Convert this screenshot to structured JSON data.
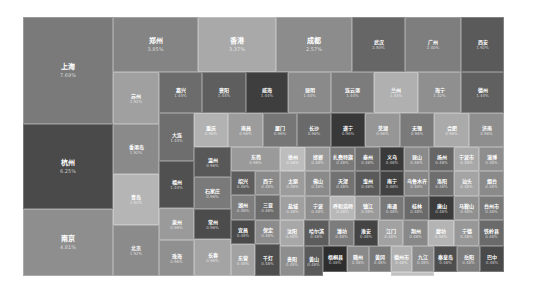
{
  "chart_data": {
    "type": "treemap",
    "title": "",
    "unit": "%",
    "items": [
      {
        "name": "上海",
        "value": 7.69,
        "label": "7.69%",
        "x": 0,
        "y": 0,
        "w": 90,
        "h": 107,
        "color": "#7a7a7a"
      },
      {
        "name": "杭州",
        "value": 6.25,
        "label": "6.25%",
        "x": 0,
        "y": 107,
        "w": 90,
        "h": 85,
        "color": "#4a4a4a"
      },
      {
        "name": "南京",
        "value": 4.81,
        "label": "4.81%",
        "x": 0,
        "y": 192,
        "w": 90,
        "h": 67,
        "color": "#8e8e8e"
      },
      {
        "name": "郑州",
        "value": 3.85,
        "label": "3.85%",
        "x": 90,
        "y": 0,
        "w": 85,
        "h": 55,
        "color": "#848484"
      },
      {
        "name": "香港",
        "value": 3.37,
        "label": "3.37%",
        "x": 175,
        "y": 0,
        "w": 78,
        "h": 55,
        "color": "#a9a9a9"
      },
      {
        "name": "成都",
        "value": 2.57,
        "label": "2.57%",
        "x": 253,
        "y": 0,
        "w": 76,
        "h": 55,
        "color": "#8c8c8c"
      },
      {
        "name": "武汉",
        "value": 2.5,
        "label": "2.50%",
        "x": 329,
        "y": 0,
        "w": 53,
        "h": 55,
        "color": "#666666"
      },
      {
        "name": "广州",
        "value": 2.4,
        "label": "2.40%",
        "x": 382,
        "y": 0,
        "w": 56,
        "h": 55,
        "color": "#7e7e7e"
      },
      {
        "name": "西安",
        "value": 1.92,
        "label": "1.92%",
        "x": 438,
        "y": 0,
        "w": 43,
        "h": 55,
        "color": "#5a5a5a"
      },
      {
        "name": "苏州",
        "value": 1.92,
        "label": "1.92%",
        "x": 90,
        "y": 55,
        "w": 46,
        "h": 52,
        "color": "#a0a0a0"
      },
      {
        "name": "嘉兴",
        "value": 1.44,
        "label": "1.44%",
        "x": 136,
        "y": 55,
        "w": 43,
        "h": 41,
        "color": "#6c6c6c"
      },
      {
        "name": "襄阳",
        "value": 1.44,
        "label": "1.44%",
        "x": 179,
        "y": 55,
        "w": 44,
        "h": 41,
        "color": "#5e5e5e"
      },
      {
        "name": "威海",
        "value": 1.44,
        "label": "1.44%",
        "x": 223,
        "y": 55,
        "w": 42,
        "h": 41,
        "color": "#3e3e3e"
      },
      {
        "name": "昆明",
        "value": 1.44,
        "label": "1.44%",
        "x": 265,
        "y": 55,
        "w": 43,
        "h": 41,
        "color": "#8a8a8a"
      },
      {
        "name": "连云港",
        "value": 1.44,
        "label": "1.44%",
        "x": 308,
        "y": 55,
        "w": 43,
        "h": 41,
        "color": "#7c7c7c"
      },
      {
        "name": "兰州",
        "value": 1.44,
        "label": "1.44%",
        "x": 351,
        "y": 55,
        "w": 44,
        "h": 41,
        "color": "#b0b0b0"
      },
      {
        "name": "海宁",
        "value": 1.32,
        "label": "1.32%",
        "x": 395,
        "y": 55,
        "w": 43,
        "h": 41,
        "color": "#8f8f8f"
      },
      {
        "name": "德州",
        "value": 1.44,
        "label": "1.44%",
        "x": 438,
        "y": 55,
        "w": 43,
        "h": 41,
        "color": "#606060"
      },
      {
        "name": "香港岛",
        "value": 1.92,
        "label": "1.92%",
        "x": 90,
        "y": 107,
        "w": 46,
        "h": 50,
        "color": "#8a8a8a"
      },
      {
        "name": "青岛",
        "value": 1.92,
        "label": "1.92%",
        "x": 90,
        "y": 157,
        "w": 46,
        "h": 51,
        "color": "#b5b5b5"
      },
      {
        "name": "北京",
        "value": 1.92,
        "label": "1.92%",
        "x": 90,
        "y": 208,
        "w": 46,
        "h": 51,
        "color": "#8b8b8b"
      },
      {
        "name": "大连",
        "value": 1.44,
        "label": "1.44%",
        "x": 136,
        "y": 96,
        "w": 35,
        "h": 48,
        "color": "#6e6e6e"
      },
      {
        "name": "福州",
        "value": 1.44,
        "label": "1.44%",
        "x": 136,
        "y": 144,
        "w": 35,
        "h": 47,
        "color": "#505050"
      },
      {
        "name": "泉州",
        "value": 0.96,
        "label": "0.96%",
        "x": 136,
        "y": 191,
        "w": 35,
        "h": 32,
        "color": "#9a9a9a"
      },
      {
        "name": "珠海",
        "value": 0.96,
        "label": "0.96%",
        "x": 136,
        "y": 223,
        "w": 35,
        "h": 36,
        "color": "#909090"
      },
      {
        "name": "重庆",
        "value": 0.96,
        "label": "0.96%",
        "x": 171,
        "y": 96,
        "w": 34,
        "h": 34,
        "color": "#b2b2b2"
      },
      {
        "name": "南昌",
        "value": 0.96,
        "label": "0.96%",
        "x": 205,
        "y": 96,
        "w": 35,
        "h": 34,
        "color": "#9c9c9c"
      },
      {
        "name": "厦门",
        "value": 0.96,
        "label": "0.96%",
        "x": 240,
        "y": 96,
        "w": 34,
        "h": 34,
        "color": "#767676"
      },
      {
        "name": "长沙",
        "value": 0.96,
        "label": "0.96%",
        "x": 274,
        "y": 96,
        "w": 34,
        "h": 34,
        "color": "#6a6a6a"
      },
      {
        "name": "遂宁",
        "value": 0.96,
        "label": "0.96%",
        "x": 308,
        "y": 96,
        "w": 34,
        "h": 34,
        "color": "#383838"
      },
      {
        "name": "芜湖",
        "value": 0.96,
        "label": "0.96%",
        "x": 342,
        "y": 96,
        "w": 35,
        "h": 34,
        "color": "#969696"
      },
      {
        "name": "无锡",
        "value": 0.96,
        "label": "0.96%",
        "x": 377,
        "y": 96,
        "w": 34,
        "h": 34,
        "color": "#7a7a7a"
      },
      {
        "name": "合肥",
        "value": 0.96,
        "label": "0.96%",
        "x": 411,
        "y": 96,
        "w": 35,
        "h": 34,
        "color": "#aaaaaa"
      },
      {
        "name": "济南",
        "value": 0.96,
        "label": "0.96%",
        "x": 446,
        "y": 96,
        "w": 35,
        "h": 34,
        "color": "#8e8e8e"
      },
      {
        "name": "温州",
        "value": 0.96,
        "label": "0.96%",
        "x": 171,
        "y": 130,
        "w": 37,
        "h": 30,
        "color": "#585858"
      },
      {
        "name": "石家庄",
        "value": 0.96,
        "label": "0.96%",
        "x": 171,
        "y": 160,
        "w": 37,
        "h": 32,
        "color": "#7a7a7a"
      },
      {
        "name": "常州",
        "value": 0.96,
        "label": "0.96%",
        "x": 171,
        "y": 192,
        "w": 37,
        "h": 30,
        "color": "#4c4c4c"
      },
      {
        "name": "长春",
        "value": 0.96,
        "label": "0.96%",
        "x": 171,
        "y": 222,
        "w": 37,
        "h": 37,
        "color": "#a4a4a4"
      },
      {
        "name": "东莞",
        "value": 0.96,
        "label": "0.96%",
        "x": 208,
        "y": 130,
        "w": 49,
        "h": 24,
        "color": "#9a9a9a"
      },
      {
        "name": "绍兴",
        "value": 0.48,
        "label": "0.48%",
        "x": 208,
        "y": 154,
        "w": 24,
        "h": 24,
        "color": "#5e5e5e"
      },
      {
        "name": "西宁",
        "value": 0.48,
        "label": "0.48%",
        "x": 232,
        "y": 154,
        "w": 25,
        "h": 24,
        "color": "#8a8a8a"
      },
      {
        "name": "湖州",
        "value": 0.48,
        "label": "0.48%",
        "x": 208,
        "y": 178,
        "w": 24,
        "h": 25,
        "color": "#7e7e7e"
      },
      {
        "name": "三亚",
        "value": 0.48,
        "label": "0.48%",
        "x": 232,
        "y": 178,
        "w": 25,
        "h": 25,
        "color": "#6c6c6c"
      },
      {
        "name": "宜昌",
        "value": 0.48,
        "label": "0.48%",
        "x": 208,
        "y": 203,
        "w": 24,
        "h": 24,
        "color": "#4a4a4a"
      },
      {
        "name": "保定",
        "value": 0.48,
        "label": "0.48%",
        "x": 232,
        "y": 203,
        "w": 25,
        "h": 24,
        "color": "#8c8c8c"
      },
      {
        "name": "东营",
        "value": 0.48,
        "label": "0.48%",
        "x": 208,
        "y": 227,
        "w": 24,
        "h": 32,
        "color": "#a2a2a2"
      },
      {
        "name": "千灯",
        "value": 0.48,
        "label": "0.48%",
        "x": 232,
        "y": 227,
        "w": 25,
        "h": 32,
        "color": "#4e4e4e"
      },
      {
        "name": "徐州",
        "value": 0.48,
        "label": "0.48%",
        "x": 257,
        "y": 130,
        "w": 25,
        "h": 24,
        "color": "#bdbdbd"
      },
      {
        "name": "邯郸",
        "value": 0.48,
        "label": "0.48%",
        "x": 282,
        "y": 130,
        "w": 25,
        "h": 24,
        "color": "#9a9a9a"
      },
      {
        "name": "扎赉特旗",
        "value": 0.48,
        "label": "0.48%",
        "x": 307,
        "y": 130,
        "w": 25,
        "h": 24,
        "color": "#7a7a7a"
      },
      {
        "name": "泰州",
        "value": 0.48,
        "label": "0.48%",
        "x": 332,
        "y": 130,
        "w": 25,
        "h": 24,
        "color": "#6c6c6c"
      },
      {
        "name": "义乌",
        "value": 0.48,
        "label": "0.48%",
        "x": 357,
        "y": 130,
        "w": 24,
        "h": 24,
        "color": "#3a3a3a"
      },
      {
        "name": "昆山",
        "value": 0.48,
        "label": "0.48%",
        "x": 381,
        "y": 130,
        "w": 25,
        "h": 24,
        "color": "#8a8a8a"
      },
      {
        "name": "扬州",
        "value": 0.48,
        "label": "0.48%",
        "x": 406,
        "y": 130,
        "w": 25,
        "h": 24,
        "color": "#666666"
      },
      {
        "name": "宁波市",
        "value": 0.48,
        "label": "0.48%",
        "x": 431,
        "y": 130,
        "w": 25,
        "h": 24,
        "color": "#a8a8a8"
      },
      {
        "name": "淄博",
        "value": 0.48,
        "label": "0.48%",
        "x": 456,
        "y": 130,
        "w": 25,
        "h": 24,
        "color": "#8e8e8e"
      },
      {
        "name": "太原",
        "value": 0.48,
        "label": "0.48%",
        "x": 257,
        "y": 154,
        "w": 25,
        "h": 25,
        "color": "#9c9c9c"
      },
      {
        "name": "佛山",
        "value": 0.48,
        "label": "0.48%",
        "x": 282,
        "y": 154,
        "w": 25,
        "h": 25,
        "color": "#8a8a8a"
      },
      {
        "name": "天津",
        "value": 0.48,
        "label": "0.48%",
        "x": 307,
        "y": 154,
        "w": 25,
        "h": 25,
        "color": "#727272"
      },
      {
        "name": "惠州",
        "value": 0.48,
        "label": "0.48%",
        "x": 332,
        "y": 154,
        "w": 25,
        "h": 25,
        "color": "#5a5a5a"
      },
      {
        "name": "南宁",
        "value": 0.48,
        "label": "0.48%",
        "x": 357,
        "y": 154,
        "w": 24,
        "h": 25,
        "color": "#424242"
      },
      {
        "name": "乌鲁木齐",
        "value": 0.48,
        "label": "0.48%",
        "x": 381,
        "y": 154,
        "w": 25,
        "h": 25,
        "color": "#868686"
      },
      {
        "name": "洛阳",
        "value": 0.48,
        "label": "0.48%",
        "x": 406,
        "y": 154,
        "w": 25,
        "h": 25,
        "color": "#6e6e6e"
      },
      {
        "name": "汕头",
        "value": 0.48,
        "label": "0.48%",
        "x": 431,
        "y": 154,
        "w": 25,
        "h": 25,
        "color": "#a4a4a4"
      },
      {
        "name": "烟台",
        "value": 0.48,
        "label": "0.48%",
        "x": 456,
        "y": 154,
        "w": 25,
        "h": 25,
        "color": "#8a8a8a"
      },
      {
        "name": "盐城",
        "value": 0.48,
        "label": "0.48%",
        "x": 257,
        "y": 179,
        "w": 25,
        "h": 24,
        "color": "#a0a0a0"
      },
      {
        "name": "宁波",
        "value": 0.48,
        "label": "0.48%",
        "x": 282,
        "y": 179,
        "w": 25,
        "h": 24,
        "color": "#8e8e8e"
      },
      {
        "name": "呼和浩特",
        "value": 0.48,
        "label": "0.48%",
        "x": 307,
        "y": 179,
        "w": 25,
        "h": 24,
        "color": "#b8b8b8"
      },
      {
        "name": "镇江",
        "value": 0.48,
        "label": "0.48%",
        "x": 332,
        "y": 179,
        "w": 25,
        "h": 24,
        "color": "#9a9a9a"
      },
      {
        "name": "南通",
        "value": 0.48,
        "label": "0.48%",
        "x": 357,
        "y": 179,
        "w": 24,
        "h": 24,
        "color": "#787878"
      },
      {
        "name": "桂林",
        "value": 0.48,
        "label": "0.48%",
        "x": 381,
        "y": 179,
        "w": 25,
        "h": 24,
        "color": "#6a6a6a"
      },
      {
        "name": "唐山",
        "value": 0.48,
        "label": "0.48%",
        "x": 406,
        "y": 179,
        "w": 25,
        "h": 24,
        "color": "#3c3c3c"
      },
      {
        "name": "马鞍山",
        "value": 0.48,
        "label": "0.48%",
        "x": 431,
        "y": 179,
        "w": 25,
        "h": 24,
        "color": "#909090"
      },
      {
        "name": "台州市",
        "value": 0.48,
        "label": "0.48%",
        "x": 456,
        "y": 179,
        "w": 25,
        "h": 24,
        "color": "#7a7a7a"
      },
      {
        "name": "沈阳",
        "value": 0.48,
        "label": "0.48%",
        "x": 257,
        "y": 203,
        "w": 24,
        "h": 26,
        "color": "#a8a8a8"
      },
      {
        "name": "哈尔滨",
        "value": 0.48,
        "label": "0.48%",
        "x": 281,
        "y": 203,
        "w": 25,
        "h": 26,
        "color": "#5c5c5c"
      },
      {
        "name": "潍坊",
        "value": 0.48,
        "label": "0.48%",
        "x": 306,
        "y": 203,
        "w": 25,
        "h": 26,
        "color": "#7c7c7c"
      },
      {
        "name": "淮安",
        "value": 0.48,
        "label": "0.48%",
        "x": 331,
        "y": 203,
        "w": 24,
        "h": 26,
        "color": "#444444"
      },
      {
        "name": "江门",
        "value": 0.48,
        "label": "0.48%",
        "x": 355,
        "y": 203,
        "w": 25,
        "h": 26,
        "color": "#a2a2a2"
      },
      {
        "name": "荆州",
        "value": 0.48,
        "label": "0.48%",
        "x": 380,
        "y": 203,
        "w": 25,
        "h": 26,
        "color": "#888888"
      },
      {
        "name": "廊坊",
        "value": 0.48,
        "label": "0.48%",
        "x": 405,
        "y": 203,
        "w": 26,
        "h": 26,
        "color": "#b4b4b4"
      },
      {
        "name": "宁德",
        "value": 0.48,
        "label": "0.48%",
        "x": 431,
        "y": 203,
        "w": 25,
        "h": 26,
        "color": "#989898"
      },
      {
        "name": "铁岭县",
        "value": 0.48,
        "label": "0.48%",
        "x": 456,
        "y": 203,
        "w": 25,
        "h": 26,
        "color": "#6a6a6a"
      },
      {
        "name": "贵阳",
        "value": 0.48,
        "label": "0.48%",
        "x": 257,
        "y": 229,
        "w": 24,
        "h": 30,
        "color": "#8e8e8e"
      },
      {
        "name": "黄山",
        "value": 0.48,
        "label": "0.48%",
        "x": 281,
        "y": 229,
        "w": 19,
        "h": 30,
        "color": "#5a5a5a"
      },
      {
        "name": "梧桐县",
        "value": 0.48,
        "label": "0.48%",
        "x": 300,
        "y": 229,
        "w": 24,
        "h": 26,
        "color": "#2e2e2e"
      },
      {
        "name": "随州",
        "value": 0.48,
        "label": "0.48%",
        "x": 324,
        "y": 229,
        "w": 22,
        "h": 26,
        "color": "#8a8a8a"
      },
      {
        "name": "黄冈",
        "value": 0.48,
        "label": "0.48%",
        "x": 346,
        "y": 229,
        "w": 22,
        "h": 26,
        "color": "#7a7a7a"
      },
      {
        "name": "德州市",
        "value": 0.48,
        "label": "0.48%",
        "x": 368,
        "y": 229,
        "w": 21,
        "h": 26,
        "color": "#b0b0b0"
      },
      {
        "name": "九江",
        "value": 0.48,
        "label": "0.48%",
        "x": 389,
        "y": 229,
        "w": 22,
        "h": 26,
        "color": "#8c8c8c"
      },
      {
        "name": "秦皇岛",
        "value": 0.48,
        "label": "0.48%",
        "x": 411,
        "y": 229,
        "w": 23,
        "h": 26,
        "color": "#4e4e4e"
      },
      {
        "name": "岳阳",
        "value": 0.48,
        "label": "0.48%",
        "x": 434,
        "y": 229,
        "w": 23,
        "h": 26,
        "color": "#7e7e7e"
      },
      {
        "name": "巴中",
        "value": 0.48,
        "label": "0.48%",
        "x": 457,
        "y": 229,
        "w": 24,
        "h": 26,
        "color": "#4a4a4a"
      },
      {
        "name": "张家港",
        "value": 0.48,
        "label": "0.48%",
        "x": 368,
        "y": 255,
        "w": 43,
        "h": 4,
        "color": "#c0c0c0"
      }
    ]
  }
}
